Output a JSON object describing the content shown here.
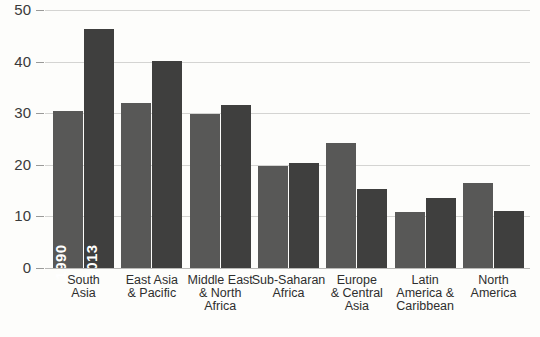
{
  "chart_data": {
    "type": "bar",
    "title": "",
    "subtitle": "",
    "xlabel": "",
    "ylabel": "",
    "ylim": [
      0,
      50
    ],
    "yticks": [
      0,
      10,
      20,
      30,
      40,
      50
    ],
    "ytick_labels": [
      "0",
      "10",
      "20",
      "30",
      "40",
      "50"
    ],
    "grid": true,
    "legend": "in-bar labels on first group",
    "categories": [
      "South Asia",
      "East Asia & Pacific",
      "Middle East & North Africa",
      "Sub-Saharan Africa",
      "Europe & Central Asia",
      "Latin America & Caribbean",
      "North America"
    ],
    "category_lines": [
      [
        "South",
        "Asia"
      ],
      [
        "East Asia",
        "& Pacific"
      ],
      [
        "Middle East",
        "& North",
        "Africa"
      ],
      [
        "Sub-Saharan",
        "Africa"
      ],
      [
        "Europe",
        "& Central",
        "Asia"
      ],
      [
        "Latin",
        "America &",
        "Caribbean"
      ],
      [
        "North",
        "America"
      ]
    ],
    "series": [
      {
        "name": "1990",
        "color": "#585857",
        "values": [
          30.5,
          32.0,
          29.8,
          19.7,
          24.3,
          10.9,
          16.4
        ]
      },
      {
        "name": "2013",
        "color": "#3f3f3e",
        "values": [
          46.4,
          40.2,
          31.5,
          20.4,
          15.4,
          13.6,
          11.1
        ]
      }
    ],
    "inbar_labels": [
      "1990",
      "2013"
    ],
    "colors": {
      "background": "#fdfdfb",
      "gridline": "#d4d4d2",
      "axis": "#b9b9b7",
      "text": "#2e2e2e",
      "bar_1990": "#585857",
      "bar_2013": "#3f3f3e",
      "inbar_text": "#ffffff"
    }
  }
}
